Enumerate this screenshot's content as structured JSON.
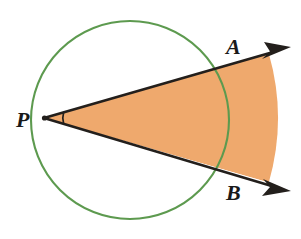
{
  "figure": {
    "background_color": "#ffffff",
    "width": 301,
    "height": 239
  },
  "circle": {
    "name": "circle",
    "stroke_color": "#5d9a4f",
    "stroke_width": 2,
    "fill": "none",
    "center_x": 130,
    "center_y": 120,
    "radius": 99
  },
  "sector": {
    "name": "shaded-sector",
    "fill_color": "#efa96d",
    "outer_radius": 222,
    "apex_x": 44,
    "apex_y": 118
  },
  "rays": {
    "stroke_color": "#231f1c",
    "stroke_width": 2.6,
    "ray_a": {
      "label": "A",
      "start_x": 44,
      "start_y": 118,
      "end_x": 288,
      "end_y": 48
    },
    "ray_b": {
      "label": "B",
      "start_x": 44,
      "start_y": 118,
      "end_x": 288,
      "end_y": 190
    }
  },
  "labels": {
    "vertex": "P",
    "point_a": "A",
    "point_b": "B"
  },
  "angle_mark": {
    "name": "angle-arc",
    "stroke_color": "#231f1c",
    "stroke_width": 1.6,
    "radius": 20
  },
  "annotations": {
    "vertex_dot_color": "#231f1c",
    "arrowhead_color": "#231f1c"
  }
}
